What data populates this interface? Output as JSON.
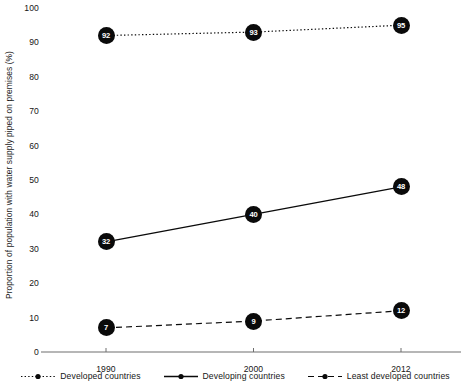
{
  "chart_data": {
    "type": "line",
    "title": "",
    "subtitle": "",
    "xlabel": "",
    "ylabel": "Proportion of population with water supply piped on premises (%)",
    "categories": [
      "1990",
      "2000",
      "2012"
    ],
    "x": [
      1990,
      2000,
      2012
    ],
    "ylim": [
      0,
      100
    ],
    "yticks": [
      "0",
      "10",
      "20",
      "30",
      "40",
      "50",
      "60",
      "70",
      "80",
      "90",
      "100"
    ],
    "ytick_values": [
      0,
      10,
      20,
      30,
      40,
      50,
      60,
      70,
      80,
      90,
      100
    ],
    "grid": false,
    "legend_position": "bottom",
    "series": [
      {
        "name": "Developed countries",
        "values": [
          92,
          93,
          95
        ],
        "labels": [
          "92",
          "93",
          "95"
        ],
        "line_style": "dotted",
        "marker": "circle",
        "color": "#0a0a0a"
      },
      {
        "name": "Developing countries",
        "values": [
          32,
          40,
          48
        ],
        "labels": [
          "32",
          "40",
          "48"
        ],
        "line_style": "solid",
        "marker": "circle",
        "color": "#0a0a0a"
      },
      {
        "name": "Least developed countries",
        "values": [
          7,
          9,
          12
        ],
        "labels": [
          "7",
          "9",
          "12"
        ],
        "line_style": "dashed",
        "marker": "circle",
        "color": "#0a0a0a"
      }
    ],
    "axis_color": "#6e6e6e",
    "text_color": "#161616"
  }
}
